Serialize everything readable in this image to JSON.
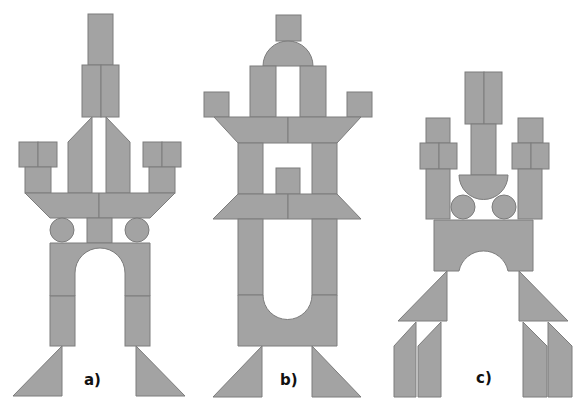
{
  "diagram": {
    "block_color": "#a3a3a3",
    "stroke_color": "#7c7c7c",
    "figures": [
      {
        "id": "a",
        "label": "a)",
        "label_pos": [
          84,
          373
        ]
      },
      {
        "id": "b",
        "label": "b)",
        "label_pos": [
          280,
          373
        ]
      },
      {
        "id": "c",
        "label": "c)",
        "label_pos": [
          476,
          371
        ]
      }
    ]
  }
}
